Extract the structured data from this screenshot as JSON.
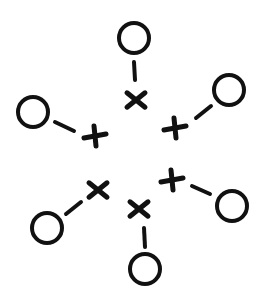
{
  "diagram": {
    "stroke_color": "#111111",
    "background": "#ffffff",
    "units": [
      {
        "id": "top",
        "circle": [
          134,
          38
        ],
        "line": [
          [
            134,
            62
          ],
          [
            135,
            80
          ]
        ],
        "cross": {
          "center": [
            136,
            100
          ],
          "type": "x"
        }
      },
      {
        "id": "upper-right",
        "circle": [
          229,
          90
        ],
        "line": [
          [
            211,
            106
          ],
          [
            196,
            118
          ]
        ],
        "cross": {
          "center": [
            175,
            128
          ],
          "type": "plus"
        }
      },
      {
        "id": "left",
        "circle": [
          33,
          112
        ],
        "line": [
          [
            55,
            122
          ],
          [
            74,
            131
          ]
        ],
        "cross": {
          "center": [
            95,
            136
          ],
          "type": "plus"
        }
      },
      {
        "id": "right",
        "circle": [
          232,
          206
        ],
        "line": [
          [
            192,
            186
          ],
          [
            210,
            194
          ]
        ],
        "cross": {
          "center": [
            172,
            180
          ],
          "type": "plus"
        }
      },
      {
        "id": "lower-left",
        "circle": [
          47,
          228
        ],
        "line": [
          [
            66,
            214
          ],
          [
            81,
            202
          ]
        ],
        "cross": {
          "center": [
            98,
            190
          ],
          "type": "x"
        }
      },
      {
        "id": "bottom",
        "circle": [
          145,
          269
        ],
        "line": [
          [
            144,
            228
          ],
          [
            145,
            247
          ]
        ],
        "cross": {
          "center": [
            139,
            209
          ],
          "type": "x"
        }
      }
    ]
  }
}
